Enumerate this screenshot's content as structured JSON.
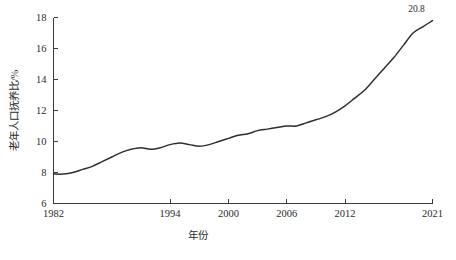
{
  "chart_data": {
    "type": "line",
    "title": "",
    "xlabel": "年份",
    "ylabel": "老年人口抚养比/%",
    "xlim": [
      1982,
      2021
    ],
    "ylim": [
      6,
      18
    ],
    "grid": false,
    "legend": null,
    "x_ticks": [
      "1982",
      "1994",
      "2000",
      "2006",
      "2012",
      "2021"
    ],
    "x_tick_values": [
      1982,
      1994,
      2000,
      2006,
      2012,
      2021
    ],
    "y_ticks": [
      "6",
      "8",
      "10",
      "12",
      "14",
      "16",
      "18"
    ],
    "y_tick_values": [
      6,
      8,
      10,
      12,
      14,
      16,
      18
    ],
    "annotations": [
      {
        "text": "20.8",
        "x": 2021,
        "y": 17.8,
        "name": "end-value-label"
      }
    ],
    "series": [
      {
        "name": "老年人口抚养比",
        "color": "#2e2e2e",
        "x": [
          1982,
          1983,
          1984,
          1985,
          1986,
          1987,
          1988,
          1989,
          1990,
          1991,
          1992,
          1993,
          1994,
          1995,
          1996,
          1997,
          1998,
          1999,
          2000,
          2001,
          2002,
          2003,
          2004,
          2005,
          2006,
          2007,
          2008,
          2009,
          2010,
          2011,
          2012,
          2013,
          2014,
          2015,
          2016,
          2017,
          2018,
          2019,
          2020,
          2021
        ],
        "values": [
          7.9,
          7.9,
          8.0,
          8.2,
          8.4,
          8.7,
          9.0,
          9.3,
          9.5,
          9.6,
          9.5,
          9.6,
          9.8,
          9.9,
          9.8,
          9.7,
          9.8,
          10.0,
          10.2,
          10.4,
          10.5,
          10.7,
          10.8,
          10.9,
          11.0,
          11.0,
          11.2,
          11.4,
          11.6,
          11.9,
          12.3,
          12.8,
          13.3,
          14.0,
          14.7,
          15.4,
          16.2,
          17.0,
          17.4,
          17.8
        ]
      }
    ]
  },
  "axis": {
    "y_axis_title": "老年人口抚养比/%",
    "x_axis_title": "年份"
  }
}
